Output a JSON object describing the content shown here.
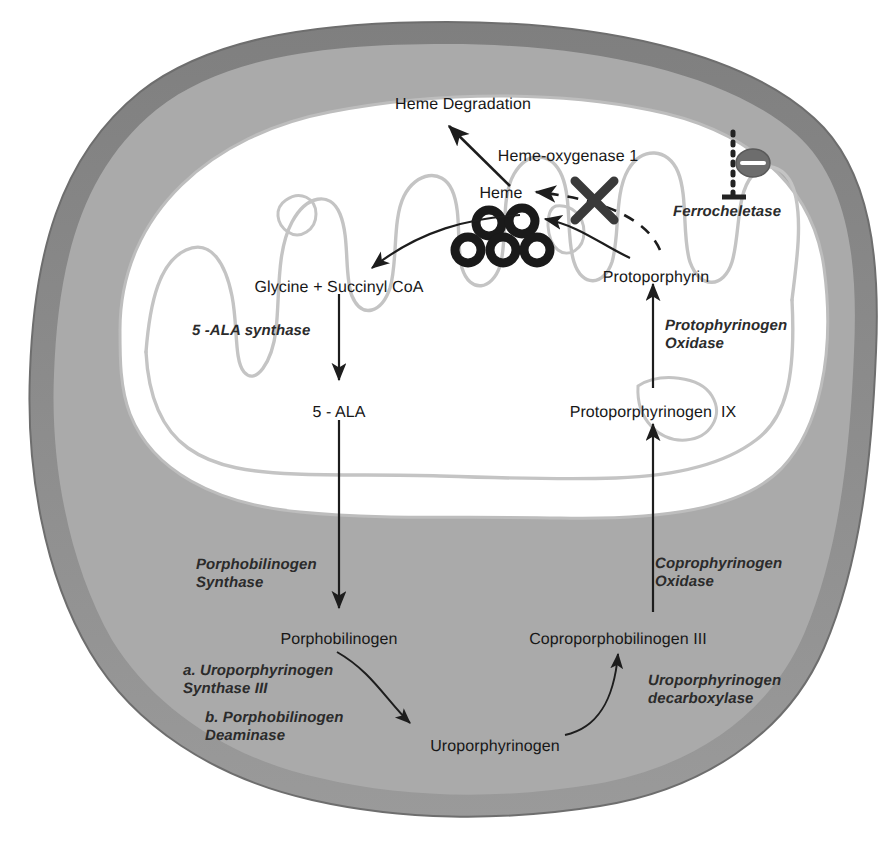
{
  "figure": {
    "kind": "biological-pathway-diagram",
    "colors": {
      "background": "#ffffff",
      "cell_membrane": "#8b8b8b",
      "cytoplasm": "#ababab",
      "mitochondrion_matrix": "#ffffff",
      "mitochondrion_outline": "#b9b9b9",
      "cristae": "#c2c2c2",
      "arrow": "#1d1d1d",
      "text": "#1d1d1d",
      "heme_ring": "#1a1a1a",
      "block_x": "#3a3a3a",
      "inhibition": "#2a2a2a"
    }
  },
  "metabolites": [
    {
      "id": "heme-degradation",
      "label": "Heme Degradation",
      "x": 463,
      "y": 96,
      "align": "center"
    },
    {
      "id": "heme",
      "label": "Heme",
      "x": 501,
      "y": 185,
      "align": "center"
    },
    {
      "id": "glycine-succinyl-coa",
      "label": "Glycine + Succinyl CoA",
      "x": 339,
      "y": 279,
      "align": "center"
    },
    {
      "id": "five-ala",
      "label": "5 - ALA",
      "x": 339,
      "y": 404,
      "align": "center"
    },
    {
      "id": "porphobilinogen",
      "label": "Porphobilinogen",
      "x": 339,
      "y": 631,
      "align": "center"
    },
    {
      "id": "uroporphyrinogen",
      "label": "Uroporphyrinogen",
      "x": 495,
      "y": 738,
      "align": "center"
    },
    {
      "id": "coproporphobilinogen-3",
      "label": "Coproporphobilinogen III",
      "x": 618,
      "y": 631,
      "align": "center"
    },
    {
      "id": "protoporphyrinogen-9",
      "label": "Protoporphyrinogen  IX",
      "x": 653,
      "y": 404,
      "align": "center"
    },
    {
      "id": "protoporphyrin",
      "label": "Protoporphyrin",
      "x": 656,
      "y": 269,
      "align": "center"
    },
    {
      "id": "heme-oxygenase-1",
      "label": "Heme-oxygenase 1",
      "x": 568,
      "y": 148,
      "align": "center"
    }
  ],
  "enzymes": [
    {
      "id": "ala-synthase",
      "lines": [
        "5 -ALA synthase"
      ],
      "x": 192,
      "y": 322,
      "align": "left"
    },
    {
      "id": "porphobilinogen-synthase",
      "lines": [
        "Porphobilinogen",
        "Synthase"
      ],
      "x": 196,
      "y": 556,
      "align": "left"
    },
    {
      "id": "uroporphyrinogen-synthase-3",
      "lines": [
        "a. Uroporphyrinogen",
        "Synthase III"
      ],
      "x": 183,
      "y": 662,
      "align": "left"
    },
    {
      "id": "porphobilinogen-deaminase",
      "lines": [
        "b. Porphobilinogen",
        "Deaminase"
      ],
      "x": 205,
      "y": 709,
      "align": "left"
    },
    {
      "id": "uroporphyrinogen-decarboxylase",
      "lines": [
        "Uroporphyrinogen",
        "decarboxylase"
      ],
      "x": 648,
      "y": 672,
      "align": "left"
    },
    {
      "id": "coprophyrinogen-oxidase",
      "lines": [
        "Coprophyrinogen",
        "Oxidase"
      ],
      "x": 655,
      "y": 555,
      "align": "left"
    },
    {
      "id": "protophyrinogen-oxidase",
      "lines": [
        "Protophyrinogen",
        "Oxidase"
      ],
      "x": 665,
      "y": 317,
      "align": "left"
    },
    {
      "id": "ferrocheletase",
      "lines": [
        "Ferrocheletase"
      ],
      "x": 673,
      "y": 203,
      "align": "left"
    }
  ],
  "heme_pool": {
    "id": "heme-molecules",
    "ring_count": 5,
    "rings": [
      {
        "cx": 489,
        "cy": 223,
        "r": 13
      },
      {
        "cx": 522,
        "cy": 221,
        "r": 13
      },
      {
        "cx": 468,
        "cy": 250,
        "r": 13
      },
      {
        "cx": 503,
        "cy": 250,
        "r": 13
      },
      {
        "cx": 537,
        "cy": 250,
        "r": 13
      }
    ]
  },
  "annotations": {
    "block_symbol": {
      "id": "ferrochelatase-block-x",
      "meaning": "blocked reaction",
      "cx": 594,
      "cy": 200
    },
    "inhibition": {
      "id": "heme-inhibition",
      "meaning": "negative feedback inhibition",
      "sign": "–",
      "cx": 745,
      "cy": 163
    }
  },
  "arrows": [
    {
      "id": "arrow-heme-to-degradation",
      "from": "heme",
      "to": "heme-degradation",
      "style": "solid-curved"
    },
    {
      "id": "arrow-heme-to-glycine",
      "from": "heme",
      "to": "glycine-succinyl-coa",
      "style": "solid-curved"
    },
    {
      "id": "arrow-glycine-to-ala",
      "from": "glycine-succinyl-coa",
      "to": "five-ala",
      "style": "solid-straight"
    },
    {
      "id": "arrow-ala-to-porphobilinogen",
      "from": "five-ala",
      "to": "porphobilinogen",
      "style": "solid-straight"
    },
    {
      "id": "arrow-porphobilinogen-to-uro",
      "from": "porphobilinogen",
      "to": "uroporphyrinogen",
      "style": "solid-curved"
    },
    {
      "id": "arrow-uro-to-copro",
      "from": "uroporphyrinogen",
      "to": "coproporphobilinogen-3",
      "style": "solid-curved"
    },
    {
      "id": "arrow-copro-to-protoporphyrinogen",
      "from": "coproporphobilinogen-3",
      "to": "protoporphyrinogen-9",
      "style": "solid-straight"
    },
    {
      "id": "arrow-protoporphyrinogen-to-proto",
      "from": "protoporphyrinogen-9",
      "to": "protoporphyrin",
      "style": "solid-straight"
    },
    {
      "id": "arrow-proto-to-heme-blocked",
      "from": "protoporphyrin",
      "to": "heme",
      "style": "dashed-blocked"
    },
    {
      "id": "arrow-proto-to-heme-pool",
      "from": "protoporphyrin",
      "to": "heme-molecules",
      "style": "solid-curved"
    }
  ]
}
